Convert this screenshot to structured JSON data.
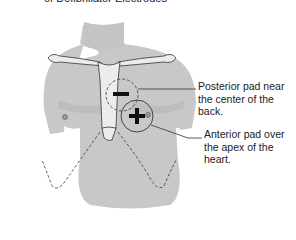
{
  "title": "of Defibrillator Electrodes",
  "labels": {
    "posterior": "Posterior pad near the center of the back.",
    "anterior": "Anterior pad over the apex of the heart."
  },
  "pads": {
    "posterior_symbol": "−",
    "anterior_symbol": "+"
  },
  "colors": {
    "skin": "#c8c8c8",
    "skin_shadow": "#b4b4b4",
    "bone": "#ececec",
    "line": "#333333"
  }
}
